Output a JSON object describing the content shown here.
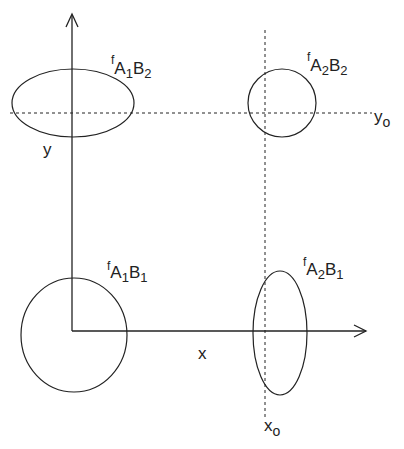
{
  "diagram": {
    "axes": {
      "x_label": "x",
      "y_label": "y",
      "x0_label": "x",
      "x0_sub": "o",
      "y0_label": "y",
      "y0_sub": "o"
    },
    "distributions": [
      {
        "id": "A1B1",
        "f": "f",
        "a": "A",
        "a_sub": "1",
        "b": "B",
        "b_sub": "1",
        "shape": "circle"
      },
      {
        "id": "A1B2",
        "f": "f",
        "a": "A",
        "a_sub": "1",
        "b": "B",
        "b_sub": "2",
        "shape": "horizontal-ellipse"
      },
      {
        "id": "A2B1",
        "f": "f",
        "a": "A",
        "a_sub": "2",
        "b": "B",
        "b_sub": "1",
        "shape": "vertical-ellipse"
      },
      {
        "id": "A2B2",
        "f": "f",
        "a": "A",
        "a_sub": "2",
        "b": "B",
        "b_sub": "2",
        "shape": "circle"
      }
    ],
    "colors": {
      "stroke": "#222222",
      "background": "#ffffff"
    }
  }
}
